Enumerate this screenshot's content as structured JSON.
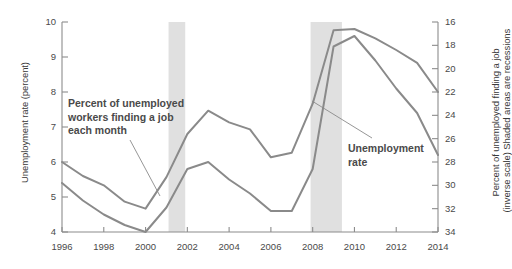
{
  "chart_data": {
    "type": "line",
    "title": "",
    "subtitle": "",
    "xlabel": "",
    "ylabel": "Unemployment rate (percent)",
    "ylabel_right_line1": "Percent of unemployed finding a job",
    "ylabel_right_line2": "(inverse scale) Shaded areas are recessions",
    "x": [
      1996,
      1997,
      1998,
      1999,
      2000,
      2001,
      2002,
      2003,
      2004,
      2005,
      2006,
      2007,
      2008,
      2009,
      2010,
      2011,
      2012,
      2013,
      2014
    ],
    "xlim": [
      1996,
      2014
    ],
    "xticks": [
      1996,
      1998,
      2000,
      2002,
      2004,
      2006,
      2008,
      2010,
      2012,
      2014
    ],
    "xticklabels": [
      "1996",
      "1998",
      "2000",
      "2002",
      "2004",
      "2006",
      "2008",
      "2010",
      "2012",
      "2014"
    ],
    "ylim": [
      4,
      10
    ],
    "yticks": [
      4,
      5,
      6,
      7,
      8,
      9,
      10
    ],
    "yticklabels": [
      "4",
      "5",
      "6",
      "7",
      "8",
      "9",
      "10"
    ],
    "ylim_right": [
      34,
      16
    ],
    "yticks_right": [
      16,
      18,
      20,
      22,
      24,
      26,
      28,
      30,
      32,
      34
    ],
    "yticklabels_right": [
      "16",
      "18",
      "20",
      "22",
      "24",
      "26",
      "28",
      "30",
      "32",
      "34"
    ],
    "right_axis_inverse": true,
    "grid": false,
    "legend": "none",
    "series": [
      {
        "name": "Percent of unemployed workers finding a job each month",
        "axis": "right",
        "color": "#8a8a8a",
        "values": [
          28.0,
          29.2,
          30.0,
          31.4,
          32.0,
          29.3,
          25.6,
          23.6,
          24.6,
          25.2,
          27.6,
          27.2,
          23.0,
          16.7,
          16.6,
          17.4,
          18.4,
          19.5,
          22.0
        ]
      },
      {
        "name": "Unemployment rate",
        "axis": "left",
        "color": "#8a8a8a",
        "values": [
          5.4,
          4.9,
          4.5,
          4.2,
          4.0,
          4.7,
          5.8,
          6.0,
          5.5,
          5.1,
          4.6,
          4.6,
          5.8,
          9.3,
          9.6,
          8.9,
          8.1,
          7.4,
          6.2
        ]
      }
    ],
    "recession_bands": [
      {
        "start": 2001.1,
        "end": 2001.9,
        "color": "#e0e0e0"
      },
      {
        "start": 2007.9,
        "end": 2009.4,
        "color": "#e0e0e0"
      }
    ],
    "annotations": [
      {
        "name": "job-finding-annotation",
        "lines": [
          "Percent of unemployed",
          "workers finding a job",
          "each month"
        ],
        "leader_from_x": 130,
        "leader_from_y": 140,
        "leader_to_x": 160,
        "leader_to_y": 196
      },
      {
        "name": "unemployment-rate-annotation",
        "lines": [
          "Unemployment",
          "rate"
        ],
        "leader_from_x": 372,
        "leader_from_y": 138,
        "leader_to_x": 312,
        "leader_to_y": 101
      }
    ]
  },
  "plot": {
    "axis_color": "#8c8c8c",
    "line_color": "#8a8a8a",
    "band_color": "#e2e2e2",
    "text_color": "#4a4a4a"
  }
}
